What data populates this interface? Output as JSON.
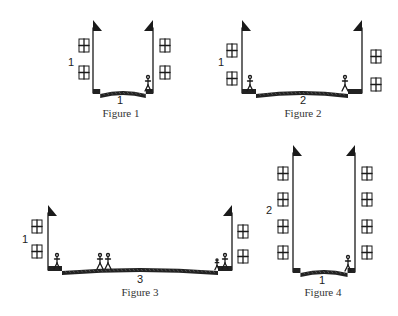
{
  "figures": [
    {
      "id": "figure-1",
      "caption": "Figure 1",
      "height_label": "1",
      "width_label": "1",
      "left_wall_x": 93,
      "right_wall_x": 153,
      "top_y": 20,
      "ground_y": 93,
      "caption_x": 121,
      "caption_y": 117,
      "width_label_x": 120,
      "width_label_y": 104,
      "height_label_x": 68,
      "height_label_y": 66,
      "left_windows": [
        [
          79,
          39
        ],
        [
          79,
          66
        ]
      ],
      "right_windows": [
        [
          160,
          39
        ],
        [
          160,
          66
        ]
      ],
      "people": [
        [
          148,
          80
        ]
      ]
    },
    {
      "id": "figure-2",
      "caption": "Figure 2",
      "height_label": "1",
      "width_label": "2",
      "left_wall_x": 242,
      "right_wall_x": 362,
      "top_y": 20,
      "ground_y": 93,
      "caption_x": 303,
      "caption_y": 117,
      "width_label_x": 303,
      "width_label_y": 104,
      "height_label_x": 218,
      "height_label_y": 66,
      "left_windows": [
        [
          227,
          44
        ],
        [
          227,
          72
        ]
      ],
      "right_windows": [
        [
          371,
          50
        ],
        [
          371,
          78
        ]
      ],
      "people": [
        [
          250,
          80
        ],
        [
          345,
          80
        ]
      ]
    },
    {
      "id": "figure-3",
      "caption": "Figure 3",
      "height_label": "1",
      "width_label": "3",
      "left_wall_x": 48,
      "right_wall_x": 232,
      "top_y": 205,
      "ground_y": 270,
      "caption_x": 140,
      "caption_y": 296,
      "width_label_x": 140,
      "width_label_y": 283,
      "height_label_x": 22,
      "height_label_y": 243,
      "left_windows": [
        [
          32,
          220
        ],
        [
          32,
          245
        ]
      ],
      "right_windows": [
        [
          238,
          225
        ],
        [
          238,
          250
        ]
      ],
      "people": [
        [
          57,
          258
        ],
        [
          100,
          258
        ],
        [
          108,
          258
        ],
        [
          225,
          258
        ]
      ],
      "child": [
        [
          217,
          262
        ]
      ]
    },
    {
      "id": "figure-4",
      "caption": "Figure 4",
      "height_label": "2",
      "width_label": "1",
      "left_wall_x": 293,
      "right_wall_x": 355,
      "top_y": 145,
      "ground_y": 272,
      "caption_x": 323,
      "caption_y": 296,
      "width_label_x": 322,
      "width_label_y": 284,
      "height_label_x": 266,
      "height_label_y": 214,
      "left_windows": [
        [
          278,
          167
        ],
        [
          278,
          193
        ],
        [
          278,
          220
        ],
        [
          278,
          246
        ]
      ],
      "right_windows": [
        [
          362,
          167
        ],
        [
          362,
          193
        ],
        [
          362,
          220
        ],
        [
          362,
          246
        ]
      ],
      "people": [
        [
          348,
          260
        ]
      ]
    }
  ]
}
